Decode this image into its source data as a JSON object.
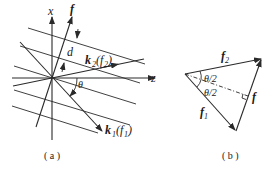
{
  "figure": {
    "panel_a": {
      "caption": "( a )",
      "axes": {
        "x_label": "x",
        "z_label": "z"
      },
      "labels": {
        "f": "f",
        "d": "d",
        "theta": "θ",
        "k2": "k",
        "k2_sub": "2",
        "k2_arg_open": "(",
        "k2_arg": "f",
        "k2_arg_sub": "2",
        "k2_arg_close": ")",
        "k1": "k",
        "k1_sub": "1",
        "k1_arg_open": "(",
        "k1_arg": "f",
        "k1_arg_sub": "1",
        "k1_arg_close": ")"
      }
    },
    "panel_b": {
      "caption": "( b )",
      "labels": {
        "f2": "f",
        "f2_sub": "2",
        "f1": "f",
        "f1_sub": "1",
        "f": "f",
        "half_angle_top": "θ/2",
        "half_angle_bottom": "θ/2"
      }
    }
  }
}
